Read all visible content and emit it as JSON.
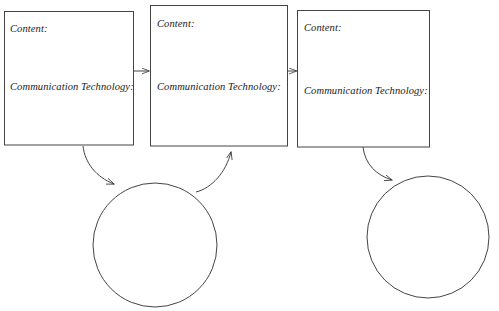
{
  "diagram": {
    "type": "process-cycle-diagram",
    "background_color": "#ffffff",
    "stroke_color": "#444444",
    "text_color": "#1a1a1a",
    "boxes": [
      {
        "id": "box-1",
        "content_label": "Content:",
        "communication_label": "Communication Technology:"
      },
      {
        "id": "box-2",
        "content_label": "Content:",
        "communication_label": "Communication Technology:"
      },
      {
        "id": "box-3",
        "content_label": "Content:",
        "communication_label": "Communication Technology:"
      }
    ],
    "circles": [
      {
        "id": "circle-1",
        "label": ""
      },
      {
        "id": "circle-2",
        "label": ""
      }
    ],
    "connectors": [
      {
        "id": "arrow-box1-box2",
        "kind": "straight",
        "from": "box-1",
        "to": "box-2"
      },
      {
        "id": "arrow-box2-box3",
        "kind": "straight",
        "from": "box-2",
        "to": "box-3"
      },
      {
        "id": "arrow-box1-circle1",
        "kind": "curved",
        "from": "box-1",
        "to": "circle-1"
      },
      {
        "id": "arrow-circle1-box2",
        "kind": "curved",
        "from": "circle-1",
        "to": "box-2"
      },
      {
        "id": "arrow-box3-circle2",
        "kind": "curved",
        "from": "box-3",
        "to": "circle-2"
      }
    ]
  }
}
